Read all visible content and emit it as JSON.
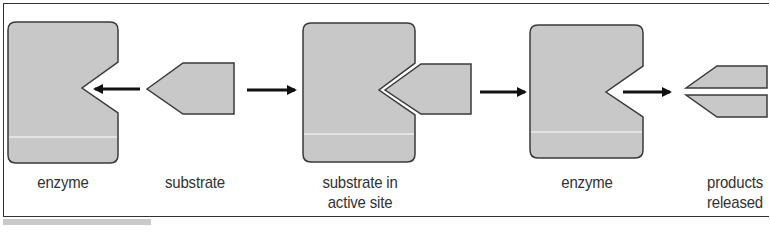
{
  "figure": {
    "colors": {
      "shape_fill": "#c8c8c8",
      "shape_stroke": "#3a3a3a",
      "arrow": "#111111",
      "text": "#333333",
      "frame": "#333333"
    },
    "stages": [
      {
        "id": "enzyme-1",
        "label": "enzyme"
      },
      {
        "id": "substrate",
        "label": "substrate"
      },
      {
        "id": "enzyme-substrate-complex",
        "label_line1": "substrate in",
        "label_line2": "active site"
      },
      {
        "id": "enzyme-2",
        "label": "enzyme"
      },
      {
        "id": "products",
        "label_line1": "products",
        "label_line2": "released"
      }
    ],
    "arrows": [
      {
        "from": "substrate",
        "to": "enzyme-1",
        "direction": "left"
      },
      {
        "from": "substrate",
        "to": "enzyme-substrate-complex",
        "direction": "right"
      },
      {
        "from": "enzyme-substrate-complex",
        "to": "enzyme-2",
        "direction": "right"
      },
      {
        "from": "enzyme-2",
        "to": "products",
        "direction": "right"
      }
    ]
  }
}
